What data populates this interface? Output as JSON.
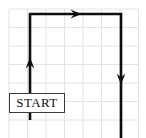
{
  "figure": {
    "type": "grid-path-diagram",
    "width": 146,
    "height": 138,
    "background_color": "#ffffff"
  },
  "grid": {
    "line_color": "#e2e2e2",
    "line_width": 1,
    "cell_size": 18.5,
    "origin_x": 9,
    "origin_y": 9,
    "columns": 7,
    "rows": 7,
    "x_lines": [
      9,
      27.5,
      46,
      64.5,
      83,
      101.5,
      120,
      138.5
    ],
    "y_lines": [
      9,
      27.5,
      46,
      64.5,
      83,
      101.5,
      120,
      138.5
    ]
  },
  "path": {
    "stroke_color": "#0d0d0d",
    "stroke_width": 2.6,
    "points": "M 30,120 L 30,14 L 121,14 L 121,138",
    "segments": [
      {
        "name": "up-segment",
        "from_x": 30,
        "from_y": 120,
        "to_x": 30,
        "to_y": 14,
        "direction": "up"
      },
      {
        "name": "right-segment",
        "from_x": 30,
        "from_y": 14,
        "to_x": 121,
        "to_y": 14,
        "direction": "right"
      },
      {
        "name": "down-segment",
        "from_x": 121,
        "from_y": 14,
        "to_x": 121,
        "to_y": 138,
        "direction": "down"
      }
    ]
  },
  "arrows": [
    {
      "name": "up-arrow",
      "direction": "up",
      "x": 30,
      "y": 63,
      "label": ""
    },
    {
      "name": "right-arrow",
      "direction": "right",
      "x": 76,
      "y": 14,
      "label": ""
    },
    {
      "name": "down-arrow",
      "direction": "down",
      "x": 121,
      "y": 79,
      "label": ""
    }
  ],
  "start_box": {
    "label": "START",
    "x": 9,
    "y": 93,
    "width": 56,
    "height": 20,
    "font_size": 13,
    "border_color": "#3a3a3a",
    "fill_color": "#ffffff",
    "text_color": "#111111"
  }
}
